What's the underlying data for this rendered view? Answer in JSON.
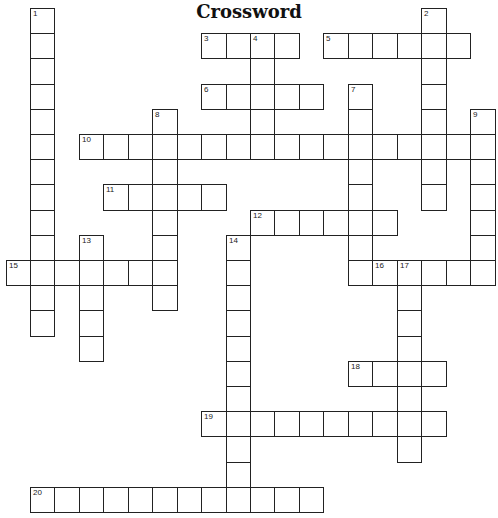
{
  "title": "Crossword",
  "grid": {
    "origin_x": 5.5,
    "origin_y": 8,
    "cell_w": 24.45,
    "cell_h": 25.2,
    "border_color": "#222222"
  },
  "entries": [
    {
      "number": 1,
      "direction": "down",
      "col": 1,
      "row": 0,
      "length": 13
    },
    {
      "number": 2,
      "direction": "down",
      "col": 17,
      "row": 0,
      "length": 8
    },
    {
      "number": 3,
      "direction": "across",
      "col": 8,
      "row": 1,
      "length": 4
    },
    {
      "number": 4,
      "direction": "down",
      "col": 10,
      "row": 1,
      "length": 5
    },
    {
      "number": 5,
      "direction": "across",
      "col": 13,
      "row": 1,
      "length": 6
    },
    {
      "number": 6,
      "direction": "across",
      "col": 8,
      "row": 3,
      "length": 5
    },
    {
      "number": 7,
      "direction": "down",
      "col": 14,
      "row": 3,
      "length": 8
    },
    {
      "number": 8,
      "direction": "down",
      "col": 6,
      "row": 4,
      "length": 8
    },
    {
      "number": 9,
      "direction": "down",
      "col": 19,
      "row": 4,
      "length": 7
    },
    {
      "number": 10,
      "direction": "across",
      "col": 3,
      "row": 5,
      "length": 17
    },
    {
      "number": 11,
      "direction": "across",
      "col": 4,
      "row": 7,
      "length": 5
    },
    {
      "number": 12,
      "direction": "across",
      "col": 10,
      "row": 8,
      "length": 6
    },
    {
      "number": 13,
      "direction": "down",
      "col": 3,
      "row": 9,
      "length": 5
    },
    {
      "number": 14,
      "direction": "down",
      "col": 9,
      "row": 9,
      "length": 11
    },
    {
      "number": 15,
      "direction": "across",
      "col": 0,
      "row": 10,
      "length": 7
    },
    {
      "number": 16,
      "direction": "across",
      "col": 15,
      "row": 10,
      "length": 5
    },
    {
      "number": 17,
      "direction": "down",
      "col": 16,
      "row": 10,
      "length": 8
    },
    {
      "number": 18,
      "direction": "across",
      "col": 14,
      "row": 14,
      "length": 4
    },
    {
      "number": 19,
      "direction": "across",
      "col": 8,
      "row": 16,
      "length": 10
    },
    {
      "number": 20,
      "direction": "across",
      "col": 1,
      "row": 19,
      "length": 12
    }
  ]
}
